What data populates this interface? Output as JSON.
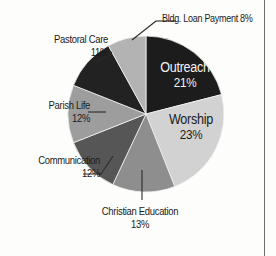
{
  "chart_data": {
    "type": "pie",
    "title": "",
    "categories": [
      "Outreach",
      "Worship",
      "Christian Education",
      "Communication",
      "Parish Life",
      "Pastoral Care",
      "Bldg. Loan Payment"
    ],
    "values": [
      21,
      23,
      13,
      12,
      12,
      11,
      8
    ],
    "value_suffix": "%",
    "legend": "none",
    "grid": false,
    "start_angle_deg": 0,
    "direction": "clockwise",
    "slice_colors": [
      "#1c1c1c",
      "#d2d2d2",
      "#8e8e8e",
      "#565656",
      "#9d9d9d",
      "#222222",
      "#b3b3b3"
    ],
    "slices": [
      {
        "name": "Outreach",
        "value": 21,
        "label": "Outreach",
        "pct": "21%",
        "color": "#1c1c1c",
        "label_placement": "inside",
        "label_color": "#f2f2f2"
      },
      {
        "name": "Worship",
        "value": 23,
        "label": "Worship",
        "pct": "23%",
        "color": "#d2d2d2",
        "label_placement": "inside",
        "label_color": "#1b1b1b"
      },
      {
        "name": "Christian Education",
        "value": 13,
        "label": "Christian Education",
        "pct": "13%",
        "color": "#8e8e8e",
        "label_placement": "outside-bottom",
        "label_color": "#1b1b1b"
      },
      {
        "name": "Communication",
        "value": 12,
        "label": "Communication",
        "pct": "12%",
        "color": "#565656",
        "label_placement": "outside-left",
        "label_color": "#1b1b1b"
      },
      {
        "name": "Parish Life",
        "value": 12,
        "label": "Parish Life",
        "pct": "12%",
        "color": "#9d9d9d",
        "label_placement": "outside-left",
        "label_color": "#1b1b1b"
      },
      {
        "name": "Pastoral Care",
        "value": 11,
        "label": "Pastoral Care",
        "pct": "11%",
        "color": "#222222",
        "label_placement": "outside-left",
        "label_color": "#1b1b1b"
      },
      {
        "name": "Bldg. Loan Payment",
        "value": 8,
        "label": "Bldg. Loan Payment 8%",
        "pct": "8%",
        "color": "#b3b3b3",
        "label_placement": "outside-top",
        "label_color": "#1b1b1b"
      }
    ]
  },
  "labels": {
    "bldg_loan": "Bldg. Loan Payment 8%",
    "pastoral_care_name": "Pastoral Care",
    "pastoral_care_pct": "11%",
    "parish_life_name": "Parish Life",
    "parish_life_pct": "12%",
    "communication_name": "Communication",
    "communication_pct": "12%",
    "christian_education_name": "Christian Education",
    "christian_education_pct": "13%",
    "outreach_name": "Outreach",
    "outreach_pct": "21%",
    "worship_name": "Worship",
    "worship_pct": "23%"
  }
}
